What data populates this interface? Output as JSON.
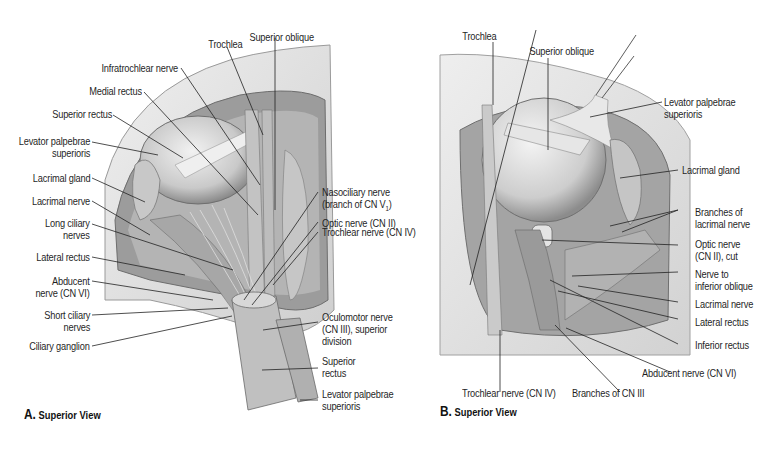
{
  "figure": {
    "panels": [
      {
        "id": "A",
        "caption_letter": "A.",
        "caption_text": "Superior View",
        "labels": {
          "trochlea": "Trochlea",
          "superior_oblique": "Superior oblique",
          "infratrochlear_nerve": "Infratrochlear nerve",
          "medial_rectus": "Medial rectus",
          "superior_rectus": "Superior rectus",
          "levator_palpebrae_1": "Levator palpebrae",
          "levator_palpebrae_2": "superioris",
          "lacrimal_gland": "Lacrimal gland",
          "lacrimal_nerve": "Lacrimal nerve",
          "long_ciliary_1": "Long ciliary",
          "long_ciliary_2": "nerves",
          "lateral_rectus": "Lateral rectus",
          "abducent_1": "Abducent",
          "abducent_2": "nerve (CN VI)",
          "short_ciliary_1": "Short ciliary",
          "short_ciliary_2": "nerves",
          "ciliary_ganglion": "Ciliary ganglion",
          "nasociliary_1": "Nasociliary nerve",
          "nasociliary_2": "(branch of CN V",
          "nasociliary_sub": "1",
          "nasociliary_3": ")",
          "optic_nerve": "Optic nerve (CN II)",
          "trochlear_nerve": "Trochlear nerve (CN IV)",
          "oculomotor_1": "Oculomotor nerve",
          "oculomotor_2": "(CN III), superior",
          "oculomotor_3": "division",
          "superior_rectus_cut_1": "Superior",
          "superior_rectus_cut_2": "rectus",
          "levator_cut_1": "Levator palpebrae",
          "levator_cut_2": "superioris"
        }
      },
      {
        "id": "B",
        "caption_letter": "B.",
        "caption_text": "Superior View",
        "labels": {
          "trochlea": "Trochlea",
          "superior_oblique": "Superior oblique",
          "levator_1": "Levator palpebrae",
          "levator_2": "superioris",
          "lacrimal_gland": "Lacrimal gland",
          "branches_lacrimal_1": "Branches of",
          "branches_lacrimal_2": "lacrimal nerve",
          "optic_cut_1": "Optic nerve",
          "optic_cut_2": "(CN II), cut",
          "nerve_inf_oblique_1": "Nerve to",
          "nerve_inf_oblique_2": "inferior oblique",
          "lacrimal_nerve": "Lacrimal nerve",
          "lateral_rectus": "Lateral rectus",
          "inferior_rectus": "Inferior rectus",
          "abducent": "Abducent nerve (CN VI)",
          "trochlear": "Trochlear nerve (CN IV)",
          "branches_cn3": "Branches of CN III"
        }
      }
    ],
    "colors": {
      "bone": "#e9e9e9",
      "bone_edge": "#9a9a9a",
      "orbit_shadow": "#8f8f8f",
      "muscle": "#b9b9b9",
      "eyeball": "#d6d6d6",
      "leader": "#222222"
    }
  }
}
